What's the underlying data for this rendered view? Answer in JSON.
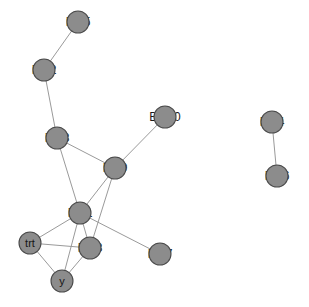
{
  "graph": {
    "title": "Biomarker network graph",
    "background_color": "#ffffff",
    "node_fill_color": "#8c8c8c",
    "node_stroke_color": "#4a4a4a",
    "edge_color": "#9a9a9a",
    "label_color": "#1a1a1a",
    "node_radius": 11,
    "nodes": [
      {
        "id": "BM5",
        "label": "BM5",
        "x": 78,
        "y": 22,
        "label_placement": "overlay"
      },
      {
        "id": "BM2",
        "label": "BM2",
        "x": 44,
        "y": 70,
        "label_placement": "overlay"
      },
      {
        "id": "BM8",
        "label": "BM8",
        "x": 57,
        "y": 138,
        "label_placement": "overlay"
      },
      {
        "id": "BM10",
        "label": "BM10",
        "x": 165,
        "y": 117,
        "label_placement": "overlay"
      },
      {
        "id": "BM9",
        "label": "BM9",
        "x": 115,
        "y": 168,
        "label_placement": "overlay"
      },
      {
        "id": "BM1",
        "label": "BM1",
        "x": 80,
        "y": 213,
        "label_placement": "overlay"
      },
      {
        "id": "trt",
        "label": "trt",
        "x": 30,
        "y": 243,
        "label_placement": "inside"
      },
      {
        "id": "BM3",
        "label": "BM3",
        "x": 90,
        "y": 248,
        "label_placement": "overlay"
      },
      {
        "id": "y",
        "label": "y",
        "x": 62,
        "y": 281,
        "label_placement": "inside"
      },
      {
        "id": "BM7",
        "label": "BM7",
        "x": 160,
        "y": 254,
        "label_placement": "overlay"
      },
      {
        "id": "BM4",
        "label": "BM4",
        "x": 272,
        "y": 122,
        "label_placement": "overlay"
      },
      {
        "id": "BM6",
        "label": "BM6",
        "x": 277,
        "y": 176,
        "label_placement": "overlay"
      }
    ],
    "edges": [
      {
        "source": "BM5",
        "target": "BM2"
      },
      {
        "source": "BM2",
        "target": "BM8"
      },
      {
        "source": "BM8",
        "target": "BM9"
      },
      {
        "source": "BM8",
        "target": "BM1"
      },
      {
        "source": "BM10",
        "target": "BM9"
      },
      {
        "source": "BM9",
        "target": "BM1"
      },
      {
        "source": "BM9",
        "target": "BM3"
      },
      {
        "source": "BM1",
        "target": "trt"
      },
      {
        "source": "BM1",
        "target": "BM3"
      },
      {
        "source": "BM1",
        "target": "y"
      },
      {
        "source": "BM1",
        "target": "BM7"
      },
      {
        "source": "trt",
        "target": "BM3"
      },
      {
        "source": "trt",
        "target": "y"
      },
      {
        "source": "BM3",
        "target": "y"
      },
      {
        "source": "BM4",
        "target": "BM6"
      }
    ]
  }
}
